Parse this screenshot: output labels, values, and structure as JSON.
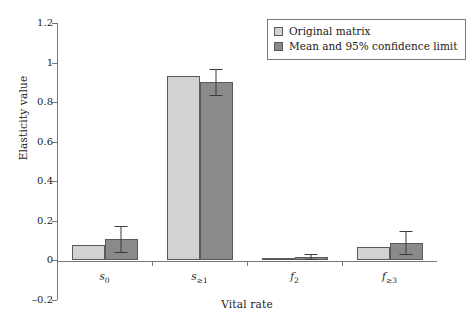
{
  "chart_data": {
    "type": "bar",
    "title": "",
    "xlabel": "Vital rate",
    "ylabel": "Elasticity value",
    "categories": [
      "s_0",
      "s_>=1",
      "f_2",
      "f_>=3"
    ],
    "category_labels_html": [
      "s<sub>0</sub>",
      "s<sub>≥1</sub>",
      "f<sub>2</sub>",
      "f<sub>≥3</sub>"
    ],
    "ylim": [
      -0.2,
      1.2
    ],
    "yticks": [
      "1.2",
      "1",
      "0.8",
      "0.6",
      "0.4",
      "0.2",
      "0",
      "-0.2"
    ],
    "ytick_values": [
      1.2,
      1.0,
      0.8,
      0.6,
      0.4,
      0.2,
      0.0,
      -0.2
    ],
    "grid": false,
    "legend_position": "top-right",
    "series": [
      {
        "name": "Original matrix",
        "color": "#d2d2d2",
        "values": [
          0.08,
          0.93,
          0.012,
          0.07
        ],
        "errors": [
          null,
          null,
          null,
          null
        ]
      },
      {
        "name": "Mean and 95% confidence limit",
        "color": "#8a8a8a",
        "values": [
          0.11,
          0.9,
          0.018,
          0.09
        ],
        "errors": [
          0.065,
          0.065,
          0.012,
          0.06
        ],
        "error_low": [
          0.045,
          0.835,
          0.006,
          0.03
        ],
        "error_high": [
          0.175,
          0.965,
          0.03,
          0.15
        ]
      }
    ]
  },
  "axes": {
    "y_title": "Elasticity value",
    "x_title": "Vital rate"
  },
  "legend": {
    "items": [
      {
        "label": "Original matrix",
        "color": "#d2d2d2"
      },
      {
        "label": "Mean and 95% confidence limit",
        "color": "#8a8a8a"
      }
    ]
  },
  "colors": {
    "series_light": "#d2d2d2",
    "series_dark": "#8a8a8a",
    "axis": "#777777",
    "bar_border": "#5a5a5a",
    "background": "#ffffff"
  }
}
